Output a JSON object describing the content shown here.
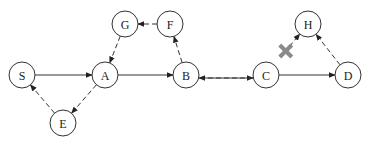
{
  "diagram": {
    "type": "directed-graph",
    "nodes": [
      {
        "id": "S",
        "label": "S"
      },
      {
        "id": "A",
        "label": "A"
      },
      {
        "id": "B",
        "label": "B"
      },
      {
        "id": "C",
        "label": "C"
      },
      {
        "id": "D",
        "label": "D"
      },
      {
        "id": "G",
        "label": "G"
      },
      {
        "id": "F",
        "label": "F"
      },
      {
        "id": "H",
        "label": "H"
      },
      {
        "id": "E",
        "label": "E"
      }
    ],
    "edges": [
      {
        "from": "S",
        "to": "A",
        "style": "solid"
      },
      {
        "from": "A",
        "to": "B",
        "style": "solid"
      },
      {
        "from": "B",
        "to": "C",
        "style": "solid"
      },
      {
        "from": "C",
        "to": "D",
        "style": "solid"
      },
      {
        "from": "G",
        "to": "A",
        "style": "dashed"
      },
      {
        "from": "F",
        "to": "G",
        "style": "dashed"
      },
      {
        "from": "B",
        "to": "F",
        "style": "dashed"
      },
      {
        "from": "A",
        "to": "E",
        "style": "dashed"
      },
      {
        "from": "E",
        "to": "S",
        "style": "dashed"
      },
      {
        "from": "C",
        "to": "B",
        "style": "dashed"
      },
      {
        "from": "D",
        "to": "H",
        "style": "dashed"
      },
      {
        "from": "C",
        "to": "H",
        "style": "dashed",
        "blocked": true
      }
    ],
    "blocked_marker": "x-mark"
  }
}
